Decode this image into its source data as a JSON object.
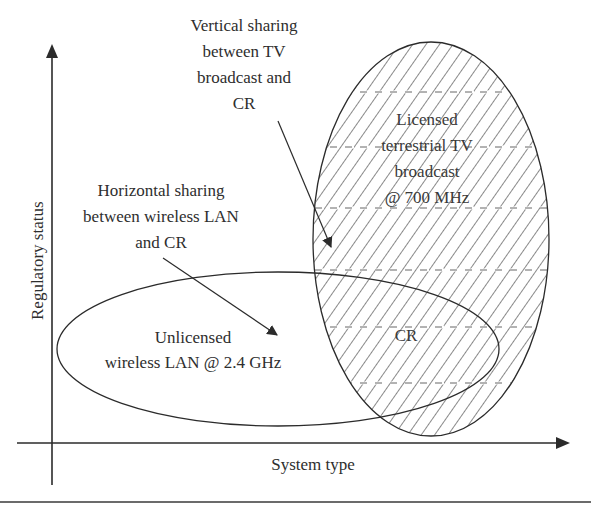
{
  "diagram": {
    "axes": {
      "y_label": "Regulatory status",
      "x_label": "System type"
    },
    "regions": {
      "licensed_tv": {
        "lines": [
          "Licensed",
          "terrestrial TV",
          "broadcast",
          "@ 700 MHz"
        ],
        "fill": "hatched"
      },
      "unlicensed_wlan": {
        "lines": [
          "Unlicensed",
          "wireless LAN @ 2.4 GHz"
        ],
        "fill": "none"
      },
      "overlap": {
        "label": "CR"
      }
    },
    "annotations": {
      "vertical_sharing": {
        "lines": [
          "Vertical sharing",
          "between TV",
          "broadcast and",
          "CR"
        ]
      },
      "horizontal_sharing": {
        "lines": [
          "Horizontal sharing",
          "between wireless LAN",
          "and CR"
        ]
      }
    },
    "colors": {
      "ink": "#2b2b2b",
      "background": "#ffffff"
    }
  }
}
